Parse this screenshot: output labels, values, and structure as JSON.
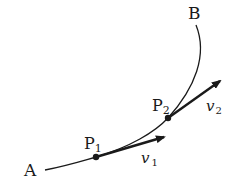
{
  "diagram": {
    "type": "curved trajectory with velocity vectors",
    "colors": {
      "stroke": "#1a1a1a",
      "background": "#ffffff"
    },
    "labels": {
      "start": "A",
      "end": "B",
      "point1": {
        "main": "P",
        "sub": "1"
      },
      "point2": {
        "main": "P",
        "sub": "2"
      },
      "velocity1": {
        "main": "v",
        "sub": "1"
      },
      "velocity2": {
        "main": "v",
        "sub": "2"
      }
    }
  }
}
